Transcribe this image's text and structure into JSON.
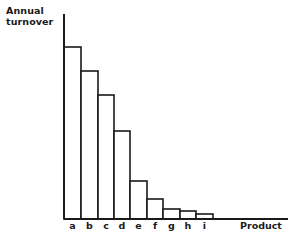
{
  "chart_data": {
    "type": "bar",
    "title": "",
    "xlabel": "Product",
    "ylabel": "Annual turnover",
    "ylabel_lines": [
      "Annual",
      "turnover"
    ],
    "categories": [
      "a",
      "b",
      "c",
      "d",
      "e",
      "f",
      "g",
      "h",
      "i"
    ],
    "values": [
      172,
      148,
      124,
      88,
      38,
      20,
      10,
      8,
      5
    ],
    "value_units": "relative (no y-axis scale shown)",
    "ylim": [
      0,
      205
    ],
    "grid": false,
    "legend": null,
    "bar_fill": "#ffffff",
    "bar_stroke": "#1a1a1a"
  }
}
